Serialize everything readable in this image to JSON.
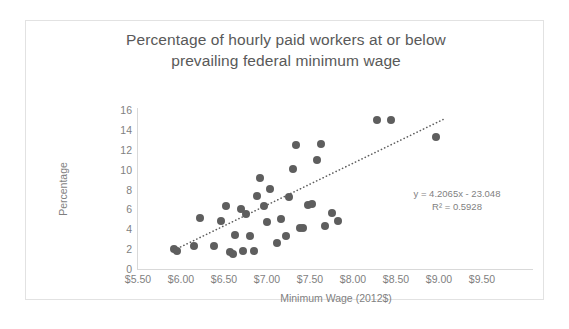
{
  "chart_data": {
    "type": "scatter",
    "title": "Percentage of hourly paid workers at or below prevailing federal minimum wage",
    "title_lines": [
      "Percentage of hourly paid workers at or below",
      "prevailing federal minimum wage"
    ],
    "xlabel": "Minimum Wage (2012$)",
    "ylabel": "Percentage",
    "xlim": [
      5.5,
      9.5
    ],
    "ylim": [
      0,
      16
    ],
    "xticks": [
      "$5.50",
      "$6.00",
      "$6.50",
      "$7.00",
      "$7.50",
      "$8.00",
      "$8.50",
      "$9.00",
      "$9.50"
    ],
    "xtick_values": [
      5.5,
      6.0,
      6.5,
      7.0,
      7.5,
      8.0,
      8.5,
      9.0,
      9.5
    ],
    "yticks": [
      "0",
      "2",
      "4",
      "6",
      "8",
      "10",
      "12",
      "14",
      "16"
    ],
    "ytick_values": [
      0,
      2,
      4,
      6,
      8,
      10,
      12,
      14,
      16
    ],
    "grid": false,
    "legend": false,
    "marker_color": "#5e5e5e",
    "axis_color": "#d9d9d9",
    "text_color": "#7f7f7f",
    "title_color": "#595959",
    "annotations": {
      "equation": "y = 4.2065x - 23.048",
      "r_squared": "R² = 0.5928",
      "slope": 4.2065,
      "intercept": -23.048,
      "r2": 0.5928
    },
    "trendline": {
      "type": "linear-dotted",
      "x_start": 5.92,
      "y_start": 1.9,
      "x_end": 9.05,
      "y_end": 15.05
    },
    "points": [
      {
        "x": 5.92,
        "y": 2.0
      },
      {
        "x": 5.95,
        "y": 1.8
      },
      {
        "x": 6.15,
        "y": 2.3
      },
      {
        "x": 6.22,
        "y": 5.1
      },
      {
        "x": 6.38,
        "y": 2.3
      },
      {
        "x": 6.47,
        "y": 4.8
      },
      {
        "x": 6.52,
        "y": 6.3
      },
      {
        "x": 6.57,
        "y": 1.7
      },
      {
        "x": 6.6,
        "y": 1.5
      },
      {
        "x": 6.63,
        "y": 3.4
      },
      {
        "x": 6.7,
        "y": 6.0
      },
      {
        "x": 6.72,
        "y": 1.8
      },
      {
        "x": 6.76,
        "y": 5.5
      },
      {
        "x": 6.8,
        "y": 3.3
      },
      {
        "x": 6.85,
        "y": 1.8
      },
      {
        "x": 6.88,
        "y": 7.3
      },
      {
        "x": 6.92,
        "y": 9.2
      },
      {
        "x": 6.96,
        "y": 6.3
      },
      {
        "x": 7.0,
        "y": 4.7
      },
      {
        "x": 7.04,
        "y": 8.1
      },
      {
        "x": 7.12,
        "y": 2.6
      },
      {
        "x": 7.16,
        "y": 5.0
      },
      {
        "x": 7.22,
        "y": 3.3
      },
      {
        "x": 7.26,
        "y": 7.2
      },
      {
        "x": 7.3,
        "y": 10.1
      },
      {
        "x": 7.34,
        "y": 12.5
      },
      {
        "x": 7.38,
        "y": 4.1
      },
      {
        "x": 7.42,
        "y": 4.1
      },
      {
        "x": 7.48,
        "y": 6.4
      },
      {
        "x": 7.52,
        "y": 6.5
      },
      {
        "x": 7.58,
        "y": 11.0
      },
      {
        "x": 7.63,
        "y": 12.6
      },
      {
        "x": 7.68,
        "y": 4.3
      },
      {
        "x": 7.76,
        "y": 5.6
      },
      {
        "x": 7.82,
        "y": 4.8
      },
      {
        "x": 8.28,
        "y": 15.0
      },
      {
        "x": 8.44,
        "y": 15.0
      },
      {
        "x": 8.97,
        "y": 13.3
      }
    ]
  }
}
